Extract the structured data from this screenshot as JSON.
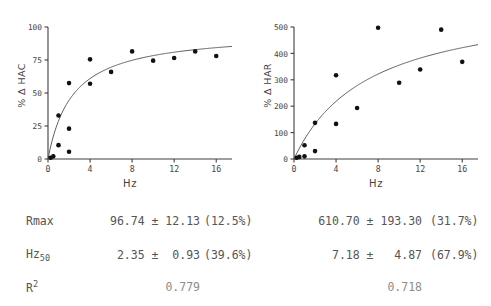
{
  "figure": {
    "background": "#ffffff",
    "axis_color": "#3f3f3f",
    "marker_color": "#111111",
    "curve_color": "#555555",
    "text_color": "#555555"
  },
  "panels": [
    {
      "id": "hac",
      "ylabel": "% Δ HAC",
      "xlabel": "Hz",
      "stats_label_rmax": "Rmax",
      "stats_label_hz50_base": "Hz",
      "stats_label_hz50_sub": "50",
      "stats_label_r2_base": "R",
      "stats_label_r2_sup": "2",
      "rmax_value": "96.74 ± 12.13",
      "rmax_pct": "(12.5%)",
      "hz50_value": "2.35 ±  0.93",
      "hz50_pct": "(39.6%)",
      "r2_value": "0.779"
    },
    {
      "id": "har",
      "ylabel": "% Δ HAR",
      "xlabel": "Hz",
      "rmax_value": "610.70 ± 193.30",
      "rmax_pct": "(31.7%)",
      "hz50_value": "7.18 ±   4.87",
      "hz50_pct": "(67.9%)",
      "r2_value": "0.718"
    }
  ],
  "chart_data": [
    {
      "type": "scatter",
      "id": "hac-panel",
      "title": "",
      "xlabel": "Hz",
      "ylabel": "% Δ HAC",
      "xlim": [
        0,
        17.5
      ],
      "ylim": [
        0,
        100
      ],
      "xticks": [
        0,
        4,
        8,
        12,
        16
      ],
      "yticks": [
        0,
        25,
        50,
        75,
        100
      ],
      "grid": false,
      "legend": null,
      "series": [
        {
          "name": "observed",
          "marker": "filled-circle",
          "x": [
            0.25,
            0.5,
            1.0,
            1.0,
            2.0,
            2.0,
            2.0,
            4.0,
            4.0,
            6.0,
            8.0,
            10.0,
            12.0,
            14.0,
            16.0
          ],
          "y": [
            1.0,
            2.0,
            10.5,
            33.0,
            5.5,
            23.0,
            57.5,
            57.0,
            75.5,
            66.0,
            81.5,
            74.5,
            76.5,
            81.5,
            78.0
          ]
        },
        {
          "name": "fitted Michaelis-Menten curve",
          "type": "line",
          "model": "y = Rmax * x / (Hz50 + x)",
          "Rmax": 96.74,
          "Hz50": 2.35,
          "R2": 0.779
        }
      ],
      "fit_parameters": {
        "Rmax": {
          "estimate": 96.74,
          "se": 12.13,
          "cv_pct": 12.5
        },
        "Hz50": {
          "estimate": 2.35,
          "se": 0.93,
          "cv_pct": 39.6
        },
        "R2": 0.779
      }
    },
    {
      "type": "scatter",
      "id": "har-panel",
      "title": "",
      "xlabel": "Hz",
      "ylabel": "% Δ HAR",
      "xlim": [
        0,
        17.5
      ],
      "ylim": [
        0,
        500
      ],
      "xticks": [
        0,
        4,
        8,
        12,
        16
      ],
      "yticks": [
        0,
        100,
        200,
        300,
        400,
        500
      ],
      "grid": false,
      "legend": null,
      "series": [
        {
          "name": "observed",
          "marker": "filled-circle",
          "x": [
            0.25,
            0.5,
            1.0,
            1.0,
            2.0,
            2.0,
            4.0,
            4.0,
            6.0,
            8.0,
            10.0,
            12.0,
            14.0,
            16.0
          ],
          "y": [
            5.0,
            8.0,
            10.0,
            52.0,
            30.0,
            137.0,
            133.0,
            317.0,
            193.0,
            497.0,
            289.0,
            339.0,
            490.0,
            368.0
          ]
        },
        {
          "name": "fitted Michaelis-Menten curve",
          "type": "line",
          "model": "y = Rmax * x / (Hz50 + x)",
          "Rmax": 610.7,
          "Hz50": 7.18,
          "R2": 0.718
        }
      ],
      "fit_parameters": {
        "Rmax": {
          "estimate": 610.7,
          "se": 193.3,
          "cv_pct": 31.7
        },
        "Hz50": {
          "estimate": 7.18,
          "se": 4.87,
          "cv_pct": 67.9
        },
        "R2": 0.718
      }
    }
  ]
}
